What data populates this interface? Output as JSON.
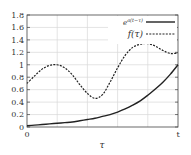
{
  "chart_data": {
    "type": "line",
    "title": "",
    "xlabel": "τ",
    "ylabel": "",
    "xlim": [
      0,
      1
    ],
    "ylim": [
      0,
      1.8
    ],
    "x_tick_labels": [
      "0",
      "t"
    ],
    "y_tick_labels": [
      "0",
      "0.2",
      "0.4",
      "0.6",
      "0.8",
      "1",
      "1.2",
      "1.4",
      "1.6",
      "1.8"
    ],
    "grid": true,
    "legend_position": "top-right",
    "x": [
      0,
      0.05,
      0.1,
      0.15,
      0.2,
      0.25,
      0.3,
      0.35,
      0.4,
      0.45,
      0.5,
      0.55,
      0.6,
      0.65,
      0.7,
      0.75,
      0.8,
      0.85,
      0.9,
      0.95,
      1.0
    ],
    "series": [
      {
        "name": "e^{a(t−τ)}",
        "style": "solid",
        "values": [
          0.02,
          0.03,
          0.04,
          0.05,
          0.06,
          0.07,
          0.08,
          0.1,
          0.12,
          0.14,
          0.17,
          0.2,
          0.24,
          0.29,
          0.35,
          0.42,
          0.51,
          0.61,
          0.72,
          0.85,
          1.0
        ]
      },
      {
        "name": "f(τ)",
        "style": "dashed",
        "values": [
          0.7,
          0.82,
          0.93,
          0.99,
          1.0,
          0.95,
          0.84,
          0.68,
          0.54,
          0.46,
          0.52,
          0.72,
          0.95,
          1.15,
          1.28,
          1.33,
          1.34,
          1.3,
          1.23,
          1.18,
          1.19
        ]
      }
    ]
  },
  "legend": {
    "entries": [
      "e^{a(t−τ)}",
      "f(τ)"
    ]
  },
  "axes": {
    "xlabel": "τ",
    "x_start": "0",
    "x_end": "t"
  }
}
